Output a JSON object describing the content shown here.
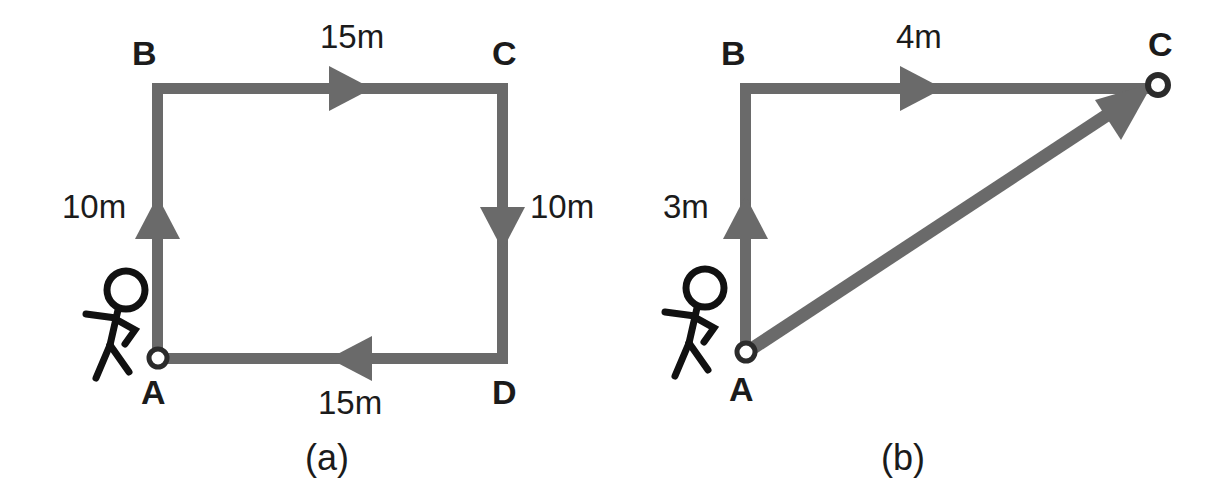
{
  "figure": {
    "line_color": "#6a6a6a",
    "text_color": "#1b1b1b",
    "background_color": "#ffffff"
  },
  "panels": [
    {
      "id": "a",
      "caption": "(a)",
      "path_type": "closed-rectangle-loop",
      "points": [
        {
          "name": "A",
          "label": "A",
          "marker": "open-circle"
        },
        {
          "name": "B",
          "label": "B",
          "marker": "none"
        },
        {
          "name": "C",
          "label": "C",
          "marker": "none"
        },
        {
          "name": "D",
          "label": "D",
          "marker": "none"
        }
      ],
      "segments": [
        {
          "from": "A",
          "to": "B",
          "label": "10m",
          "direction": "up"
        },
        {
          "from": "B",
          "to": "C",
          "label": "15m",
          "direction": "right"
        },
        {
          "from": "C",
          "to": "D",
          "label": "10m",
          "direction": "down"
        },
        {
          "from": "D",
          "to": "A",
          "label": "15m",
          "direction": "left"
        }
      ],
      "walker": {
        "name": "stick-figure",
        "facing": "right"
      }
    },
    {
      "id": "b",
      "caption": "(b)",
      "path_type": "triangle-with-resultant",
      "points": [
        {
          "name": "A",
          "label": "A",
          "marker": "open-circle"
        },
        {
          "name": "B",
          "label": "B",
          "marker": "none"
        },
        {
          "name": "C",
          "label": "C",
          "marker": "open-circle"
        }
      ],
      "segments": [
        {
          "from": "A",
          "to": "B",
          "label": "3m",
          "direction": "up"
        },
        {
          "from": "B",
          "to": "C",
          "label": "4m",
          "direction": "right"
        },
        {
          "from": "A",
          "to": "C",
          "label": "",
          "direction": "diagonal-up-right"
        }
      ],
      "walker": {
        "name": "stick-figure",
        "facing": "right"
      }
    }
  ],
  "labels": {
    "a": {
      "B": "B",
      "C": "C",
      "A": "A",
      "D": "D",
      "top": "15m",
      "bottom": "15m",
      "left": "10m",
      "right": "10m",
      "caption": "(a)"
    },
    "b": {
      "B": "B",
      "C": "C",
      "A": "A",
      "top": "4m",
      "left": "3m",
      "caption": "(b)"
    }
  }
}
